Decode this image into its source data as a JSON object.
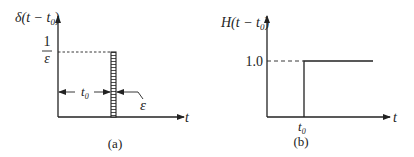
{
  "panel_a": {
    "ylabel_main": "δ(t − t",
    "ylabel_sub": "0",
    "ylabel_close": ")",
    "height_num": "1",
    "height_den": "ε",
    "width_label_main": "t",
    "width_label_sub": "0",
    "epsilon_label": "ε",
    "xlabel": "t",
    "caption": "(a)"
  },
  "panel_b": {
    "ylabel_main": "H(t − t",
    "ylabel_sub": "0",
    "ylabel_close": ")",
    "level_label": "1.0",
    "step_label_main": "t",
    "step_label_sub": "0",
    "xlabel": "t",
    "caption": "(b)"
  },
  "colors": {
    "line": "#222222",
    "background": "#ffffff"
  }
}
